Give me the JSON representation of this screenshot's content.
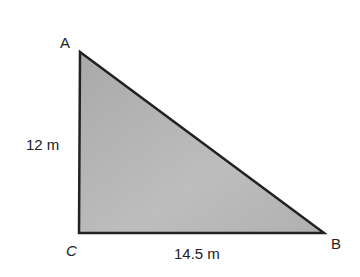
{
  "diagram": {
    "shape": "right-triangle",
    "fill_color": "#b4b4b4",
    "stroke_color": "#222222",
    "vertices": {
      "A": {
        "label": "A",
        "x": 80,
        "y": 52
      },
      "C": {
        "label": "C",
        "x": 79,
        "y": 233
      },
      "B": {
        "label": "B",
        "x": 324,
        "y": 233
      }
    },
    "sides": {
      "AC": {
        "label": "12 m"
      },
      "CB": {
        "label": "14.5 m"
      }
    }
  }
}
